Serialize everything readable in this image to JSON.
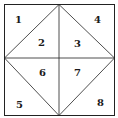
{
  "diagram": {
    "type": "square-with-inscribed-diamond",
    "stroke_color": "#222222",
    "background": "#ffffff",
    "regions": [
      {
        "id": "1",
        "label": "1"
      },
      {
        "id": "2",
        "label": "2"
      },
      {
        "id": "3",
        "label": "3"
      },
      {
        "id": "4",
        "label": "4"
      },
      {
        "id": "5",
        "label": "5"
      },
      {
        "id": "6",
        "label": "6"
      },
      {
        "id": "7",
        "label": "7"
      },
      {
        "id": "8",
        "label": "8"
      }
    ]
  }
}
